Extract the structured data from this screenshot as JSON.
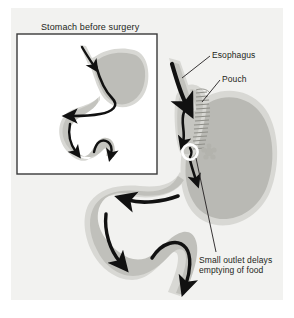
{
  "figure": {
    "type": "medical-illustration",
    "background_color": "#ffffff",
    "panel_color": "#f2f2f0"
  },
  "inset": {
    "title": "Stomach before surgery",
    "border_color": "#3a3a3a",
    "fill_color": "#ffffff"
  },
  "labels": {
    "esophagus": "Esophagus",
    "pouch": "Pouch",
    "outlet_line1": "Small outlet delays",
    "outlet_line2": "emptying of food"
  },
  "colors": {
    "organ_fill": "#b9b9b4",
    "organ_wall": "#d8d8d4",
    "outline": "#231f20",
    "arrow": "#111111",
    "staple_line": "#8e8e88",
    "outlet_ring": "#ffffff",
    "text": "#231f20"
  },
  "anatomy": {
    "esophagus": "tapering tube entering pouch from upper left",
    "pouch": "small upper stomach pouch above staple line",
    "staple_line": "hatched band of short tick marks separating pouch from bypassed stomach",
    "outlet": "white ring marking small outlet",
    "bypassed_stomach": "large rounded stomach body at right",
    "duodenum": "S-shaped small intestine descending to lower left"
  },
  "arrows": {
    "count_main": 5,
    "count_inset": 4,
    "meaning": "direction of food flow"
  }
}
